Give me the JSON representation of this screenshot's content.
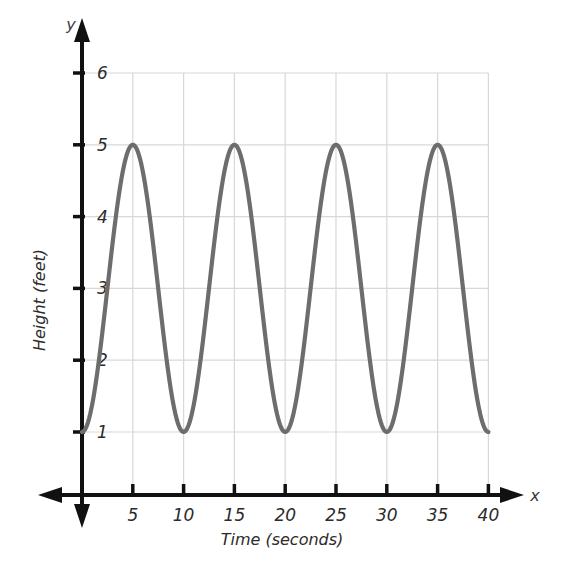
{
  "chart_data": {
    "type": "line",
    "title": "",
    "subtitle": "",
    "xlabel": "Time (seconds)",
    "ylabel": "Height (feet)",
    "x_axis_name": "x",
    "y_axis_name": "y",
    "xlim": [
      0,
      41
    ],
    "ylim": [
      0,
      6.4
    ],
    "xticks": [
      5,
      10,
      15,
      20,
      25,
      30,
      35,
      40
    ],
    "yticks": [
      1,
      2,
      3,
      4,
      5,
      6
    ],
    "xtick_labels": [
      "5",
      "10",
      "15",
      "20",
      "25",
      "30",
      "35",
      "40"
    ],
    "ytick_labels": [
      "1",
      "2",
      "3",
      "4",
      "5",
      "6"
    ],
    "grid": true,
    "grid_color": "#d8d8d8",
    "legend": false,
    "legend_position": "none",
    "curve_color": "#6d6d6d",
    "axis_color": "#111111",
    "background_color": "#ffffff",
    "series": [
      {
        "name": "Height over time",
        "function": "h(t) = 3 - 2*cos(2*pi*t/10)",
        "amplitude": 2,
        "midline": 3,
        "period": 10,
        "minimum": 1,
        "maximum": 5,
        "start_point": {
          "x": 0,
          "y": 1
        },
        "end_point": {
          "x": 40,
          "y": 1
        },
        "maxima_x": [
          5,
          15,
          25,
          35
        ],
        "maxima_y": 5,
        "minima_x": [
          0,
          10,
          20,
          30,
          40
        ],
        "minima_y": 1,
        "x": [
          0,
          1,
          2,
          3,
          4,
          5,
          6,
          7,
          8,
          9,
          10,
          11,
          12,
          13,
          14,
          15,
          16,
          17,
          18,
          19,
          20,
          21,
          22,
          23,
          24,
          25,
          26,
          27,
          28,
          29,
          30,
          31,
          32,
          33,
          34,
          35,
          36,
          37,
          38,
          39,
          40
        ],
        "values": [
          1.0,
          1.38,
          2.38,
          3.62,
          4.62,
          5.0,
          4.62,
          3.62,
          2.38,
          1.38,
          1.0,
          1.38,
          2.38,
          3.62,
          4.62,
          5.0,
          4.62,
          3.62,
          2.38,
          1.38,
          1.0,
          1.38,
          2.38,
          3.62,
          4.62,
          5.0,
          4.62,
          3.62,
          2.38,
          1.38,
          1.0,
          1.38,
          2.38,
          3.62,
          4.62,
          5.0,
          4.62,
          3.62,
          2.38,
          1.38,
          1.0
        ]
      }
    ]
  }
}
